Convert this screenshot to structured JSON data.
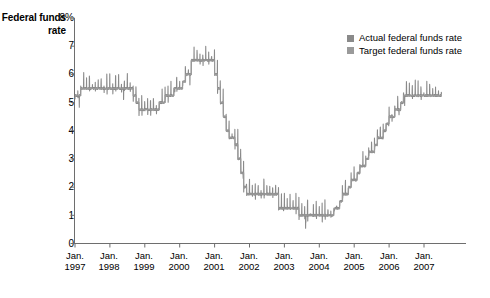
{
  "axis_title": {
    "line1": "Federal",
    "line2": "funds rate"
  },
  "legend": {
    "position": "top-right",
    "items": [
      {
        "label": "Actual federal funds rate",
        "color": "#8a8a8a"
      },
      {
        "label": "Target federal funds rate",
        "color": "#9a9a9a"
      }
    ]
  },
  "yaxis": {
    "top_label": "8%",
    "ticks": [
      "8",
      "7",
      "6",
      "5",
      "4",
      "3",
      "2",
      "1",
      "0"
    ],
    "values": [
      8,
      7,
      6,
      5,
      4,
      3,
      2,
      1,
      0
    ]
  },
  "xaxis": {
    "month": "Jan.",
    "years": [
      "1997",
      "1998",
      "1999",
      "2000",
      "2001",
      "2002",
      "2003",
      "2004",
      "2005",
      "2006",
      "2007"
    ]
  },
  "chart_data": {
    "type": "line",
    "title": "Federal funds rate",
    "xlabel": "",
    "ylabel": "Federal funds rate",
    "ylim": [
      0,
      8
    ],
    "xlim": [
      "1997-01",
      "2007-06"
    ],
    "grid": false,
    "legend_position": "top-right",
    "tick_labels_y": [
      "0",
      "1",
      "2",
      "3",
      "4",
      "5",
      "6",
      "7",
      "8%"
    ],
    "tick_labels_x": [
      "Jan. 1997",
      "Jan. 1998",
      "Jan. 1999",
      "Jan. 2000",
      "Jan. 2001",
      "Jan. 2002",
      "Jan. 2003",
      "Jan. 2004",
      "Jan. 2005",
      "Jan. 2006",
      "Jan. 2007"
    ],
    "series": [
      {
        "name": "Target federal funds rate",
        "color": "#9a9a9a",
        "style": "step",
        "x": [
          "1997-01",
          "1997-03",
          "1998-09",
          "1998-10",
          "1998-11",
          "1999-06",
          "1999-08",
          "1999-11",
          "2000-02",
          "2000-03",
          "2000-05",
          "2001-01",
          "2001-02",
          "2001-03",
          "2001-04",
          "2001-05",
          "2001-06",
          "2001-08",
          "2001-09",
          "2001-10",
          "2001-11",
          "2001-12",
          "2002-11",
          "2003-06",
          "2004-06",
          "2004-08",
          "2004-09",
          "2004-11",
          "2004-12",
          "2005-02",
          "2005-03",
          "2005-05",
          "2005-06",
          "2005-08",
          "2005-09",
          "2005-11",
          "2005-12",
          "2006-01",
          "2006-03",
          "2006-05",
          "2006-06",
          "2007-06"
        ],
        "values": [
          5.25,
          5.5,
          5.25,
          5.0,
          4.75,
          5.0,
          5.25,
          5.5,
          5.75,
          6.0,
          6.5,
          6.0,
          5.5,
          5.0,
          4.5,
          4.0,
          3.75,
          3.5,
          3.0,
          2.5,
          2.0,
          1.75,
          1.25,
          1.0,
          1.25,
          1.5,
          1.75,
          2.0,
          2.25,
          2.5,
          2.75,
          3.0,
          3.25,
          3.5,
          3.75,
          4.0,
          4.25,
          4.5,
          4.75,
          5.0,
          5.25,
          5.25
        ]
      },
      {
        "name": "Actual federal funds rate",
        "color": "#8a8a8a",
        "style": "noisy-line",
        "note": "daily effective rate; tracks target with short-term noise and month-end spikes",
        "x": [
          "1997-01",
          "1997-04",
          "1997-07",
          "1997-10",
          "1998-01",
          "1998-04",
          "1998-07",
          "1998-10",
          "1999-01",
          "1999-04",
          "1999-07",
          "1999-10",
          "2000-01",
          "2000-04",
          "2000-07",
          "2000-10",
          "2001-01",
          "2001-04",
          "2001-07",
          "2001-10",
          "2002-01",
          "2002-04",
          "2002-07",
          "2002-10",
          "2003-01",
          "2003-04",
          "2003-07",
          "2003-10",
          "2004-01",
          "2004-04",
          "2004-07",
          "2004-10",
          "2005-01",
          "2005-04",
          "2005-07",
          "2005-10",
          "2006-01",
          "2006-04",
          "2006-07",
          "2006-10",
          "2007-01",
          "2007-04",
          "2007-06"
        ],
        "values": [
          5.25,
          5.5,
          5.5,
          5.5,
          5.5,
          5.5,
          5.5,
          5.1,
          4.7,
          4.75,
          5.0,
          5.2,
          5.5,
          6.0,
          6.5,
          6.5,
          5.9,
          4.6,
          3.7,
          2.4,
          1.75,
          1.75,
          1.75,
          1.75,
          1.25,
          1.25,
          1.0,
          1.0,
          1.0,
          1.0,
          1.25,
          1.75,
          2.25,
          2.75,
          3.25,
          3.75,
          4.25,
          4.75,
          5.25,
          5.25,
          5.25,
          5.25,
          5.25
        ]
      }
    ]
  }
}
